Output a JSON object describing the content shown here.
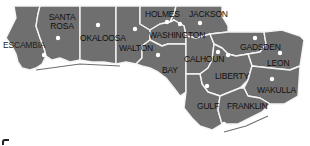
{
  "map": {
    "region": "Florida Panhandle",
    "colors": {
      "county_fill": "#6f6f6f",
      "border": "#f4f4f4",
      "seat_marker": "#ffffff",
      "label": "#111111",
      "background": "#ffffff"
    },
    "counties": [
      {
        "name": "ESCAMBIA",
        "label_x": 3,
        "label_y": 41
      },
      {
        "name": "SANTA\nROSA",
        "label_x": 46,
        "label_y": 13
      },
      {
        "name": "OKALOOSA",
        "label_x": 80,
        "label_y": 35
      },
      {
        "name": "WALTON",
        "label_x": 119,
        "label_y": 44
      },
      {
        "name": "HOLMES",
        "label_x": 145,
        "label_y": 10
      },
      {
        "name": "JACKSON",
        "label_x": 189,
        "label_y": 10
      },
      {
        "name": "WASHINGTON",
        "label_x": 149,
        "label_y": 31
      },
      {
        "name": "BAY",
        "label_x": 162,
        "label_y": 66
      },
      {
        "name": "CALHOUN",
        "label_x": 184,
        "label_y": 55
      },
      {
        "name": "GADSDEN",
        "label_x": 240,
        "label_y": 43
      },
      {
        "name": "LEON",
        "label_x": 267,
        "label_y": 59
      },
      {
        "name": "LIBERTY",
        "label_x": 215,
        "label_y": 72
      },
      {
        "name": "WAKULLA",
        "label_x": 257,
        "label_y": 86
      },
      {
        "name": "GULF",
        "label_x": 197,
        "label_y": 103
      },
      {
        "name": "FRANKLIN",
        "label_x": 227,
        "label_y": 103
      }
    ],
    "seats": [
      [
        58,
        38
      ],
      [
        44,
        55
      ],
      [
        98,
        25
      ],
      [
        135,
        29
      ],
      [
        167,
        22
      ],
      [
        180,
        24
      ],
      [
        200,
        23
      ],
      [
        158,
        55
      ],
      [
        218,
        52
      ],
      [
        228,
        55
      ],
      [
        255,
        38
      ],
      [
        280,
        53
      ],
      [
        272,
        79
      ],
      [
        207,
        86
      ],
      [
        224,
        124
      ]
    ]
  }
}
